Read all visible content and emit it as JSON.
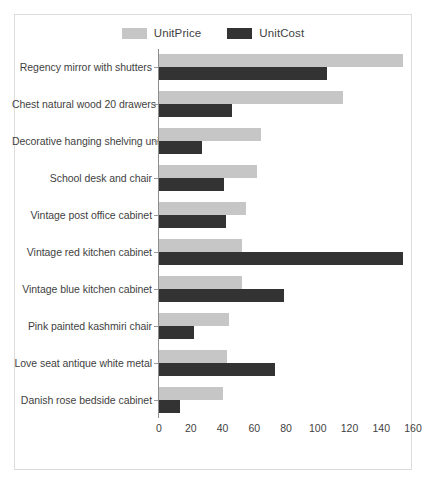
{
  "chart_data": {
    "type": "bar",
    "orientation": "horizontal",
    "title": "",
    "xlabel": "",
    "ylabel": "",
    "xlim": [
      0,
      160
    ],
    "xticks": [
      0,
      20,
      40,
      60,
      80,
      100,
      120,
      140,
      160
    ],
    "grid": false,
    "legend_position": "top-center",
    "categories": [
      "Regency mirror with shutters",
      "Chest natural wood 20 drawers",
      "Decorative hanging shelving unit",
      "School desk and chair",
      "Vintage post office cabinet",
      "Vintage red kitchen cabinet",
      "Vintage blue kitchen cabinet",
      "Pink painted kashmiri chair",
      "Love seat antique white metal",
      "Danish rose bedside cabinet"
    ],
    "series": [
      {
        "name": "UnitPrice",
        "color": "#c6c6c6",
        "values": [
          154,
          116,
          64,
          62,
          55,
          52,
          52,
          44,
          43,
          40
        ]
      },
      {
        "name": "UnitCost",
        "color": "#333333",
        "values": [
          106,
          46,
          27,
          41,
          42,
          154,
          79,
          22,
          73,
          13
        ]
      }
    ]
  },
  "legend": {
    "entries": [
      {
        "label": "UnitPrice",
        "color": "#c6c6c6"
      },
      {
        "label": "UnitCost",
        "color": "#333333"
      }
    ]
  },
  "axis": {
    "tick_labels": [
      "0",
      "20",
      "40",
      "60",
      "80",
      "100",
      "120",
      "140",
      "160"
    ]
  }
}
